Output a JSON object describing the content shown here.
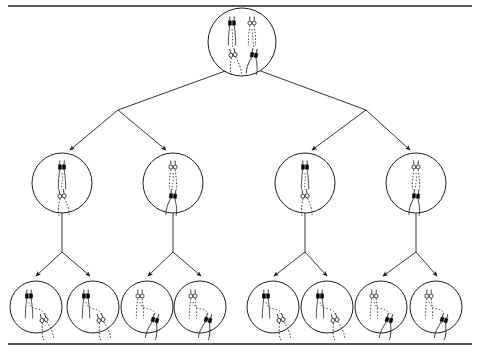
{
  "figure": {
    "background_color": "#ffffff",
    "stroke_color": "#231f20",
    "fill_solid_color": "#000000",
    "fill_outline_color": "#ffffff",
    "width": 480,
    "height": 352,
    "border": {
      "top": {
        "x1": 8,
        "y1": 6,
        "x2": 472,
        "y2": 6,
        "width": 1.6
      },
      "bottom": {
        "x1": 8,
        "y1": 344,
        "x2": 472,
        "y2": 344,
        "width": 1.6
      }
    }
  },
  "legend_note": "Solid (black) chromosomes and outline (white) chromosomes represent the two homologous sets; dashed lines are spindle fibers.",
  "cells": [
    {
      "id": "parent-cell",
      "name": "parent-cell",
      "row": 0,
      "index": 0,
      "cx": 242,
      "cy": 42,
      "r": 34,
      "stage": "metaphase-i",
      "chromosomes": [
        {
          "name": "chromosome-long-solid",
          "type": "solid",
          "size": "long",
          "x": 232,
          "y": 23,
          "angle": 0
        },
        {
          "name": "chromosome-long-outline",
          "type": "outline",
          "size": "long",
          "x": 252,
          "y": 23,
          "angle": 0
        },
        {
          "name": "chromosome-short-outline",
          "type": "outline",
          "size": "short",
          "x": 233,
          "y": 55,
          "angle": -10
        },
        {
          "name": "chromosome-short-solid",
          "type": "solid",
          "size": "short",
          "x": 254,
          "y": 55,
          "angle": 8
        }
      ]
    },
    {
      "id": "cell-2-1",
      "name": "daughter-cell-1",
      "row": 1,
      "index": 0,
      "cx": 62,
      "cy": 183,
      "r": 30,
      "stage": "metaphase-ii",
      "chromosomes": [
        {
          "name": "chromosome-long-solid",
          "type": "solid",
          "size": "long",
          "x": 62,
          "y": 167,
          "angle": 0
        },
        {
          "name": "chromosome-short-outline",
          "type": "outline",
          "size": "short",
          "x": 62,
          "y": 196,
          "angle": -6
        }
      ]
    },
    {
      "id": "cell-2-2",
      "name": "daughter-cell-2",
      "row": 1,
      "index": 1,
      "cx": 173,
      "cy": 183,
      "r": 30,
      "stage": "metaphase-ii",
      "chromosomes": [
        {
          "name": "chromosome-long-outline",
          "type": "outline",
          "size": "long",
          "x": 173,
          "y": 167,
          "angle": 0
        },
        {
          "name": "chromosome-short-solid",
          "type": "solid",
          "size": "short",
          "x": 173,
          "y": 196,
          "angle": 6
        }
      ]
    },
    {
      "id": "cell-2-3",
      "name": "daughter-cell-3",
      "row": 1,
      "index": 2,
      "cx": 305,
      "cy": 183,
      "r": 30,
      "stage": "metaphase-ii",
      "chromosomes": [
        {
          "name": "chromosome-long-solid",
          "type": "solid",
          "size": "long",
          "x": 305,
          "y": 167,
          "angle": 0
        },
        {
          "name": "chromosome-short-outline",
          "type": "outline",
          "size": "short",
          "x": 305,
          "y": 196,
          "angle": -6
        }
      ]
    },
    {
      "id": "cell-2-4",
      "name": "daughter-cell-4",
      "row": 1,
      "index": 3,
      "cx": 416,
      "cy": 183,
      "r": 30,
      "stage": "metaphase-ii",
      "chromosomes": [
        {
          "name": "chromosome-long-outline",
          "type": "outline",
          "size": "long",
          "x": 416,
          "y": 167,
          "angle": 0
        },
        {
          "name": "chromosome-short-solid",
          "type": "solid",
          "size": "short",
          "x": 416,
          "y": 196,
          "angle": 6
        }
      ]
    },
    {
      "id": "cell-3-1",
      "name": "gamete-cell-1",
      "row": 2,
      "index": 0,
      "cx": 36,
      "cy": 307,
      "r": 26,
      "stage": "gamete",
      "chromosomes": [
        {
          "name": "chromosome-long-solid",
          "type": "solid",
          "size": "long",
          "x": 29,
          "y": 296,
          "angle": 0
        },
        {
          "name": "chromosome-short-outline",
          "type": "outline",
          "size": "short",
          "x": 44,
          "y": 320,
          "angle": -14
        }
      ]
    },
    {
      "id": "cell-3-2",
      "name": "gamete-cell-2",
      "row": 2,
      "index": 1,
      "cx": 93,
      "cy": 307,
      "r": 26,
      "stage": "gamete",
      "chromosomes": [
        {
          "name": "chromosome-long-solid",
          "type": "solid",
          "size": "long",
          "x": 86,
          "y": 296,
          "angle": 0
        },
        {
          "name": "chromosome-short-outline",
          "type": "outline",
          "size": "short",
          "x": 101,
          "y": 320,
          "angle": -14
        }
      ]
    },
    {
      "id": "cell-3-3",
      "name": "gamete-cell-3",
      "row": 2,
      "index": 2,
      "cx": 147,
      "cy": 307,
      "r": 26,
      "stage": "gamete",
      "chromosomes": [
        {
          "name": "chromosome-long-outline",
          "type": "outline",
          "size": "long",
          "x": 140,
          "y": 296,
          "angle": 0
        },
        {
          "name": "chromosome-short-solid",
          "type": "solid",
          "size": "short",
          "x": 155,
          "y": 320,
          "angle": 14
        }
      ]
    },
    {
      "id": "cell-3-4",
      "name": "gamete-cell-4",
      "row": 2,
      "index": 3,
      "cx": 200,
      "cy": 307,
      "r": 26,
      "stage": "gamete",
      "chromosomes": [
        {
          "name": "chromosome-long-outline",
          "type": "outline",
          "size": "long",
          "x": 193,
          "y": 296,
          "angle": 0
        },
        {
          "name": "chromosome-short-solid",
          "type": "solid",
          "size": "short",
          "x": 208,
          "y": 320,
          "angle": 14
        }
      ]
    },
    {
      "id": "cell-3-5",
      "name": "gamete-cell-5",
      "row": 2,
      "index": 4,
      "cx": 273,
      "cy": 307,
      "r": 26,
      "stage": "gamete",
      "chromosomes": [
        {
          "name": "chromosome-long-solid",
          "type": "solid",
          "size": "long",
          "x": 266,
          "y": 296,
          "angle": 0
        },
        {
          "name": "chromosome-short-outline",
          "type": "outline",
          "size": "short",
          "x": 281,
          "y": 320,
          "angle": -14
        }
      ]
    },
    {
      "id": "cell-3-6",
      "name": "gamete-cell-6",
      "row": 2,
      "index": 5,
      "cx": 327,
      "cy": 307,
      "r": 26,
      "stage": "gamete",
      "chromosomes": [
        {
          "name": "chromosome-long-solid",
          "type": "solid",
          "size": "long",
          "x": 320,
          "y": 296,
          "angle": 0
        },
        {
          "name": "chromosome-short-outline",
          "type": "outline",
          "size": "short",
          "x": 335,
          "y": 320,
          "angle": -14
        }
      ]
    },
    {
      "id": "cell-3-7",
      "name": "gamete-cell-7",
      "row": 2,
      "index": 6,
      "cx": 381,
      "cy": 307,
      "r": 26,
      "stage": "gamete",
      "chromosomes": [
        {
          "name": "chromosome-long-outline",
          "type": "outline",
          "size": "long",
          "x": 374,
          "y": 296,
          "angle": 0
        },
        {
          "name": "chromosome-short-solid",
          "type": "solid",
          "size": "short",
          "x": 389,
          "y": 320,
          "angle": 14
        }
      ]
    },
    {
      "id": "cell-3-8",
      "name": "gamete-cell-8",
      "row": 2,
      "index": 7,
      "cx": 436,
      "cy": 307,
      "r": 26,
      "stage": "gamete",
      "chromosomes": [
        {
          "name": "chromosome-long-outline",
          "type": "outline",
          "size": "long",
          "x": 429,
          "y": 296,
          "angle": 0
        },
        {
          "name": "chromosome-short-solid",
          "type": "solid",
          "size": "short",
          "x": 444,
          "y": 320,
          "angle": 14
        }
      ]
    }
  ],
  "connectors": [
    {
      "name": "branch-parent-left",
      "from": [
        228,
        70
      ],
      "stem_to": [
        118,
        110
      ],
      "targets": [
        [
          70,
          150
        ],
        [
          166,
          150
        ]
      ]
    },
    {
      "name": "branch-parent-right",
      "from": [
        258,
        70
      ],
      "stem_to": [
        366,
        110
      ],
      "targets": [
        [
          312,
          150
        ],
        [
          410,
          150
        ]
      ]
    },
    {
      "name": "branch-cell-2-1",
      "from": [
        62,
        213
      ],
      "stem_to": [
        62,
        252
      ],
      "targets": [
        [
          36,
          276
        ],
        [
          90,
          276
        ]
      ]
    },
    {
      "name": "branch-cell-2-2",
      "from": [
        173,
        213
      ],
      "stem_to": [
        173,
        252
      ],
      "targets": [
        [
          148,
          276
        ],
        [
          201,
          276
        ]
      ]
    },
    {
      "name": "branch-cell-2-3",
      "from": [
        305,
        213
      ],
      "stem_to": [
        305,
        252
      ],
      "targets": [
        [
          274,
          276
        ],
        [
          327,
          276
        ]
      ]
    },
    {
      "name": "branch-cell-2-4",
      "from": [
        416,
        213
      ],
      "stem_to": [
        416,
        252
      ],
      "targets": [
        [
          383,
          276
        ],
        [
          437,
          276
        ]
      ]
    }
  ]
}
